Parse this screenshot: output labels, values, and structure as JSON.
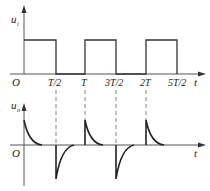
{
  "top_plot": {
    "ylabel": "u",
    "ylabel_sub": "i",
    "origin": "O",
    "xlabel": "t",
    "ticks": [
      "T/2",
      "T",
      "3T/2",
      "2T",
      "5T/2"
    ]
  },
  "bottom_plot": {
    "ylabel": "u",
    "ylabel_sub": "o",
    "origin": "O",
    "xlabel": "t"
  },
  "colors": {
    "line": "#333333",
    "axis": "#555555",
    "dash": "#666666"
  }
}
